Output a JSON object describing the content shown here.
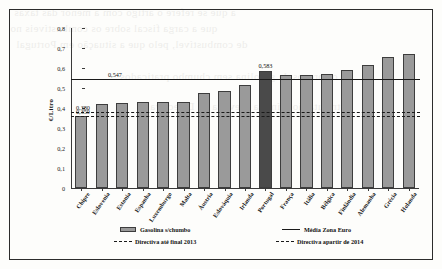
{
  "chart_data": {
    "type": "bar",
    "title": "",
    "xlabel": "",
    "ylabel": "€/Litro",
    "ylim": [
      0,
      0.8
    ],
    "ytick_labels": [
      "0,8",
      "0,7",
      "0,6",
      "0,5",
      "0,4",
      "0,3",
      "0,2",
      "0,1",
      "0"
    ],
    "ytick_values": [
      0.8,
      0.7,
      0.6,
      0.5,
      0.4,
      0.3,
      0.2,
      0.1,
      0
    ],
    "grid": false,
    "legend_position": "bottom",
    "categories": [
      "Chipre",
      "Eslovenia",
      "Estonia",
      "Espanha",
      "Luxemburgo",
      "Malta",
      "Áustria",
      "Eslováquia",
      "Irlanda",
      "Portugal",
      "França",
      "Itália",
      "Bélgica",
      "Finlândia",
      "Alemanha",
      "Grécia",
      "Holanda"
    ],
    "series": [
      {
        "name": "Gasolina s/chumbo",
        "values": [
          0.359,
          0.421,
          0.426,
          0.431,
          0.431,
          0.431,
          0.474,
          0.486,
          0.514,
          0.583,
          0.567,
          0.564,
          0.571,
          0.589,
          0.613,
          0.654,
          0.671
        ]
      }
    ],
    "highlight_category": "Portugal",
    "highlight_label": "0,583",
    "reference_lines": [
      {
        "name": "Média Zona Euro",
        "value": 0.547,
        "label": "0,547",
        "style": "solid"
      },
      {
        "name": "Directiva até final 2013",
        "value": 0.38,
        "label": "0,380",
        "style": "dashed"
      },
      {
        "name": "Directiva apartir de 2014",
        "value": 0.359,
        "label": "0,359",
        "style": "dashed"
      }
    ],
    "colors": {
      "bar": "#9a9a9a",
      "bar_highlight": "#4a4a4a",
      "line": "#1a1a1a",
      "axis": "#3a3a3a"
    }
  },
  "legend": {
    "items": [
      {
        "marker": "swatch",
        "label": "Gasolina s/chumbo"
      },
      {
        "marker": "solid",
        "label": "Média Zona Euro"
      },
      {
        "marker": "dashed",
        "label": "Directiva até final 2013"
      },
      {
        "marker": "dashed",
        "label": "Directiva apartir de 2014"
      }
    ]
  },
  "background_bleed": {
    "lines": [
      "a que se refere o artigo com a menor das taxas",
      "que a carga fiscal sobre os combustíveis no",
      "de combustível, pelo que a situação em Portugal",
      "os preços da gasolina sem chumbo praticados",
      "tributação mínima prevista na Directiva"
    ]
  }
}
